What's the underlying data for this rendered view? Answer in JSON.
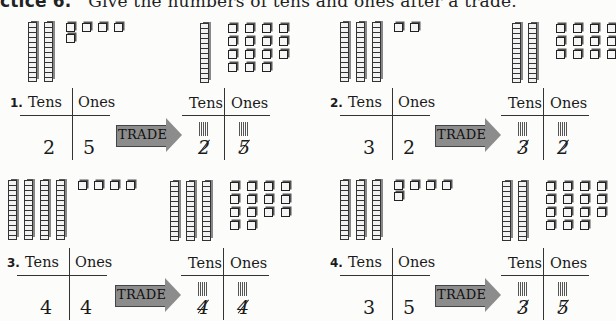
{
  "instructions": {
    "prefix": "ctice 6.",
    "text": "Give the numbers of tens and ones after a trade."
  },
  "labels": {
    "tens": "Tens",
    "ones": "Ones",
    "trade": "TRADE"
  },
  "problems": [
    {
      "number": "1.",
      "before": {
        "tens": "2",
        "ones": "5",
        "rods": 2,
        "cubes": 5
      },
      "after": {
        "tens_crossed": "2",
        "ones_crossed": "5",
        "rods": 1,
        "cubes": 15
      }
    },
    {
      "number": "2.",
      "before": {
        "tens": "3",
        "ones": "2",
        "rods": 3,
        "cubes": 2
      },
      "after": {
        "tens_crossed": "3",
        "ones_crossed": "2",
        "rods": 2,
        "cubes": 12
      }
    },
    {
      "number": "3.",
      "before": {
        "tens": "4",
        "ones": "4",
        "rods": 4,
        "cubes": 4
      },
      "after": {
        "tens_crossed": "4",
        "ones_crossed": "4",
        "rods": 3,
        "cubes": 14
      }
    },
    {
      "number": "4.",
      "before": {
        "tens": "3",
        "ones": "5",
        "rods": 3,
        "cubes": 5
      },
      "after": {
        "tens_crossed": "3",
        "ones_crossed": "5",
        "rods": 2,
        "cubes": 15
      }
    }
  ]
}
